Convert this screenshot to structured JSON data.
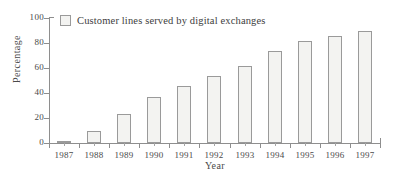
{
  "chart_data": {
    "type": "bar",
    "title": "",
    "subtitle": "",
    "xlabel": "Year",
    "ylabel": "Percentage",
    "categories": [
      "1987",
      "1988",
      "1989",
      "1990",
      "1991",
      "1992",
      "1993",
      "1994",
      "1995",
      "1996",
      "1997"
    ],
    "values": [
      1,
      9.5,
      23,
      37,
      45.5,
      53.5,
      62,
      74,
      81.5,
      85.5,
      90
    ],
    "series": [
      {
        "name": "Customer lines served by digital exchanges",
        "values": [
          1,
          9.5,
          23,
          37,
          45.5,
          53.5,
          62,
          74,
          81.5,
          85.5,
          90
        ]
      }
    ],
    "ylim": [
      0,
      100
    ],
    "y_ticks": [
      0,
      20,
      40,
      60,
      80,
      100
    ],
    "y_tick_labels": [
      "0",
      "20",
      "40",
      "60",
      "80",
      "100"
    ],
    "x_tick_labels": [
      "1987",
      "1988",
      "1989",
      "1990",
      "1991",
      "1992",
      "1993",
      "1994",
      "1995",
      "1996",
      "1997"
    ],
    "grid": false,
    "legend": {
      "position": "top-left",
      "entries": [
        "Customer lines served by digital exchanges"
      ]
    },
    "colors": {
      "bar_fill": "#f3f3f1",
      "bar_stroke": "#9a9a9a",
      "axis": "#8e8e8e",
      "text": "#3d3d3d",
      "background": "#ffffff"
    }
  },
  "legend": {
    "label": "Customer lines served by digital exchanges"
  },
  "axes": {
    "y_title": "Percentage",
    "x_title": "Year"
  }
}
